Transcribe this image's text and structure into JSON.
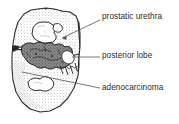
{
  "figure": {
    "type": "anatomical-illustration",
    "style": "stippled pen-and-ink line drawing, grayscale",
    "background_color": "#ffffff",
    "outline_color": "#2b2b2b",
    "stipple_color": "#7d7d7d",
    "tumor_color": "#575757",
    "lumen_color": "#ffffff",
    "leader_line_color": "#555555"
  },
  "labels": [
    {
      "id": "prostatic-urethra",
      "text": "prostatic urethra",
      "x": 102,
      "y": 12,
      "leader": {
        "x1": 100,
        "y1": 20,
        "x2": 62,
        "y2": 38
      }
    },
    {
      "id": "posterior-lobe",
      "text": "posterior lobe",
      "x": 102,
      "y": 51,
      "leader": {
        "x1": 100,
        "y1": 57,
        "x2": 72,
        "y2": 57
      }
    },
    {
      "id": "adenocarcinoma",
      "text": "adenocarcinoma",
      "x": 102,
      "y": 83,
      "leader": {
        "x1": 100,
        "y1": 88,
        "x2": 22,
        "y2": 72
      }
    }
  ]
}
